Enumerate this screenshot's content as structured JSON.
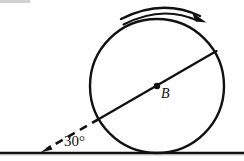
{
  "figure": {
    "title_alt": "Circle rolling on an inclined line diagram",
    "background_color": "#ffffff",
    "stroke_color": "#111111",
    "labels": {
      "angle": "30°",
      "center": "B"
    },
    "ground_line": {
      "name": "ground-line",
      "x1": 0,
      "y1": 153,
      "x2": 244,
      "y2": 153,
      "stroke_width": 2.2
    },
    "circle": {
      "name": "rolling-circle",
      "cx": 157,
      "cy": 86,
      "r": 67,
      "stroke_width": 2.2,
      "fill": "none"
    },
    "center_dot": {
      "name": "center-point-B",
      "cx": 157,
      "cy": 86,
      "r": 3.1
    },
    "diameter": {
      "name": "diameter-line",
      "angle_deg": 30,
      "x1": 99,
      "y1": 119,
      "x2": 216,
      "y2": 52,
      "stroke_width": 2.2
    },
    "dashed_extension": {
      "name": "dashed-extension-line",
      "x1": 99,
      "y1": 119,
      "x2": 45,
      "y2": 150,
      "stroke_width": 2.4,
      "dash_pattern": "7 6"
    },
    "dashed_arrowhead": {
      "name": "dashed-line-arrowhead",
      "tip_x": 41,
      "tip_y": 152
    },
    "rotation_arc": {
      "name": "rotation-arc",
      "direction": "clockwise",
      "start_x": 121,
      "start_y": 19,
      "end_x": 199,
      "end_y": 17,
      "stroke_width": 2.2
    },
    "rotation_arrowhead": {
      "name": "rotation-arc-arrowhead",
      "tip_x": 205,
      "tip_y": 22
    }
  }
}
